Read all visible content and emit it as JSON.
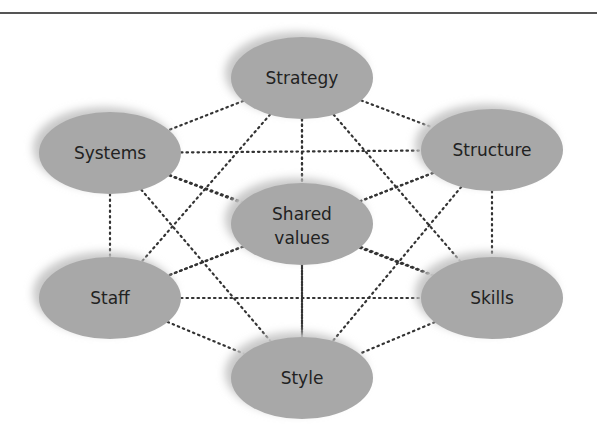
{
  "diagram": {
    "colors": {
      "node_fill": "#a8a8a8",
      "shadow": "#c8c8c8",
      "edge": "#333333",
      "top_rule": "#555555"
    },
    "nodes": [
      {
        "id": "strategy",
        "label": "Strategy",
        "cx": 302,
        "cy": 78
      },
      {
        "id": "systems",
        "label": "Systems",
        "cx": 110,
        "cy": 153
      },
      {
        "id": "structure",
        "label": "Structure",
        "cx": 492,
        "cy": 150
      },
      {
        "id": "shared",
        "label": "Shared",
        "label2": "values",
        "cx": 302,
        "cy": 224
      },
      {
        "id": "staff",
        "label": "Staff",
        "cx": 110,
        "cy": 298
      },
      {
        "id": "skills",
        "label": "Skills",
        "cx": 492,
        "cy": 298
      },
      {
        "id": "style",
        "label": "Style",
        "cx": 302,
        "cy": 378
      }
    ],
    "edges": "all pairs connected with dotted lines"
  }
}
